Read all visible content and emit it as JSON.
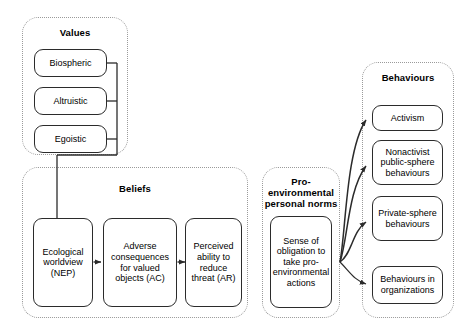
{
  "diagram": {
    "groups": {
      "values": {
        "title": "Values",
        "items": [
          {
            "label": "Biospheric"
          },
          {
            "label": "Altruistic"
          },
          {
            "label": "Egoistic"
          }
        ]
      },
      "beliefs": {
        "title": "Beliefs",
        "items": [
          {
            "label": "Ecological worldview (NEP)"
          },
          {
            "label": "Adverse consequences for valued objects (AC)"
          },
          {
            "label": "Perceived ability to reduce threat (AR)"
          }
        ]
      },
      "norms": {
        "title": "Pro-environmental personal norms",
        "items": [
          {
            "label": "Sense of obligation to take pro-environmental actions"
          }
        ]
      },
      "behaviours": {
        "title": "Behaviours",
        "items": [
          {
            "label": "Activism"
          },
          {
            "label": "Nonactivist public-sphere behaviours"
          },
          {
            "label": "Private-sphere behaviours"
          },
          {
            "label": "Behaviours in organizations"
          }
        ]
      }
    },
    "colors": {
      "node_border": "#2b2b2b",
      "group_border": "#9a9a9a",
      "connector": "#2b2b2b",
      "background": "#ffffff",
      "text": "#000000"
    },
    "connectors": [
      {
        "name": "values-to-beliefs",
        "from": "values-group",
        "to": "ecological-worldview",
        "style": "orthogonal",
        "arrowhead": false
      },
      {
        "name": "nep-to-ac",
        "from": "ecological-worldview",
        "to": "adverse-consequences",
        "style": "straight",
        "arrowhead": true
      },
      {
        "name": "ac-to-ar",
        "from": "adverse-consequences",
        "to": "perceived-ability",
        "style": "straight",
        "arrowhead": true
      },
      {
        "name": "norms-to-activism",
        "from": "sense-of-obligation",
        "to": "activism",
        "style": "curved",
        "arrowhead": true
      },
      {
        "name": "norms-to-nonactivist",
        "from": "sense-of-obligation",
        "to": "nonactivist-public-sphere",
        "style": "curved",
        "arrowhead": true
      },
      {
        "name": "norms-to-private",
        "from": "sense-of-obligation",
        "to": "private-sphere",
        "style": "curved",
        "arrowhead": true
      },
      {
        "name": "norms-to-organizations",
        "from": "sense-of-obligation",
        "to": "behaviours-in-organizations",
        "style": "curved",
        "arrowhead": true
      }
    ]
  }
}
